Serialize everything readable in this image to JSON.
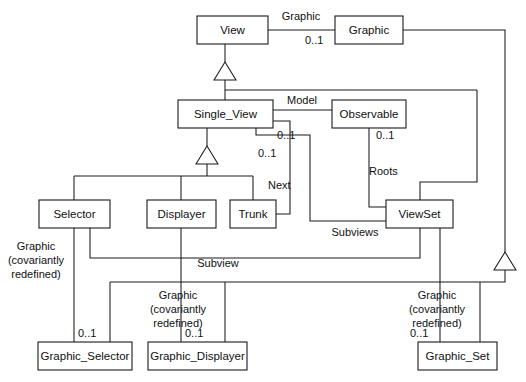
{
  "diagram": {
    "type": "uml-class-diagram",
    "title": "",
    "background_color": "#ffffff",
    "line_color": "#1a1a1a",
    "text_color": "#101010",
    "classes": [
      {
        "id": "view",
        "name": "View",
        "x": 197,
        "y": 16,
        "w": 71,
        "h": 28
      },
      {
        "id": "graphic",
        "name": "Graphic",
        "x": 335,
        "y": 16,
        "w": 68,
        "h": 28
      },
      {
        "id": "single_view",
        "name": "Single_View",
        "x": 178,
        "y": 100,
        "w": 95,
        "h": 28
      },
      {
        "id": "observable",
        "name": "Observable",
        "x": 332,
        "y": 100,
        "w": 74,
        "h": 28
      },
      {
        "id": "selector",
        "name": "Selector",
        "x": 39,
        "y": 200,
        "w": 71,
        "h": 28
      },
      {
        "id": "displayer",
        "name": "Displayer",
        "x": 147,
        "y": 200,
        "w": 69,
        "h": 28
      },
      {
        "id": "trunk",
        "name": "Trunk",
        "x": 230,
        "y": 200,
        "w": 46,
        "h": 28
      },
      {
        "id": "viewset",
        "name": "ViewSet",
        "x": 386,
        "y": 200,
        "w": 67,
        "h": 28
      },
      {
        "id": "graphic_selector",
        "name": "Graphic_Selector",
        "x": 38,
        "y": 342,
        "w": 94,
        "h": 28
      },
      {
        "id": "graphic_displayer",
        "name": "Graphic_Displayer",
        "x": 148,
        "y": 342,
        "w": 99,
        "h": 28
      },
      {
        "id": "graphic_set",
        "name": "Graphic_Set",
        "x": 418,
        "y": 342,
        "w": 79,
        "h": 28
      }
    ],
    "associations": [
      {
        "id": "view-graphic",
        "role": "Graphic",
        "source": "view",
        "target": "graphic",
        "multiplicity": "0..1"
      },
      {
        "id": "single_view-observable",
        "role": "Model",
        "source": "single_view",
        "target": "observable",
        "multiplicity": "0..1"
      },
      {
        "id": "single_view-next",
        "role": "Next",
        "source": "single_view",
        "target": "trunk",
        "multiplicity": "0..1"
      },
      {
        "id": "observable-viewset-roots",
        "role": "Roots",
        "source": "observable",
        "target": "viewset",
        "multiplicity": "0..1"
      },
      {
        "id": "viewset-subviews",
        "role": "Subviews",
        "source": "viewset",
        "target": "single_view",
        "multiplicity": ""
      },
      {
        "id": "selector-subview",
        "role": "Subview",
        "source": "selector",
        "target": "viewset",
        "multiplicity": ""
      },
      {
        "id": "selector-graphic-selector",
        "role": "Graphic\n(covariantly\nredefined)",
        "source": "selector",
        "target": "graphic_selector",
        "multiplicity": "0..1"
      },
      {
        "id": "displayer-graphic-displayer",
        "role": "Graphic\n(covariantly\nredefined)",
        "source": "displayer",
        "target": "graphic_displayer",
        "multiplicity": "0..1"
      },
      {
        "id": "viewset-graphic-set",
        "role": "Graphic\n(covariantly\nredefined)",
        "source": "viewset",
        "target": "graphic_set",
        "multiplicity": "0..1"
      }
    ],
    "generalizations": [
      {
        "id": "gen-view",
        "parent": "view",
        "children": [
          "single_view",
          "viewset"
        ]
      },
      {
        "id": "gen-single",
        "parent": "single_view",
        "children": [
          "selector",
          "displayer",
          "trunk"
        ]
      },
      {
        "id": "gen-graphic",
        "parent": "graphic",
        "children": [
          "graphic_selector",
          "graphic_displayer",
          "graphic_set"
        ]
      }
    ],
    "labels": {
      "graphic_top": "Graphic",
      "model": "Model",
      "next": "Next",
      "roots": "Roots",
      "subviews": "Subviews",
      "subview": "Subview",
      "covariant_line1": "Graphic",
      "covariant_line2": "(covariantly",
      "covariant_line3": "redefined)",
      "mult_0_1": "0..1"
    }
  }
}
